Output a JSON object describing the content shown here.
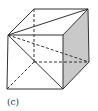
{
  "figure": {
    "caption": "(c)",
    "shade_color": "#c9c9c9",
    "stroke_color": "#333333",
    "vertices": {
      "front_top_left": [
        8,
        35
      ],
      "front_top_right": [
        63,
        35
      ],
      "front_bottom_right": [
        63,
        89
      ],
      "front_bottom_left": [
        7,
        89
      ],
      "back_top_left": [
        34,
        9
      ],
      "back_top_right": [
        88,
        9
      ],
      "back_bottom_right": [
        89,
        62
      ],
      "back_bottom_left": [
        34,
        62
      ]
    }
  }
}
